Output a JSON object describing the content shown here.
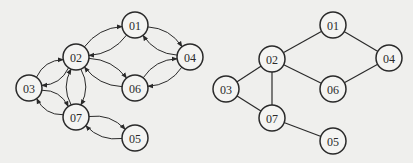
{
  "directed_graph": {
    "title": "",
    "nodes": [
      {
        "id": "01",
        "label": "01",
        "x": 135,
        "y": 25
      },
      {
        "id": "02",
        "label": "02",
        "x": 76,
        "y": 57
      },
      {
        "id": "03",
        "label": "03",
        "x": 29,
        "y": 88
      },
      {
        "id": "04",
        "label": "04",
        "x": 190,
        "y": 57
      },
      {
        "id": "06",
        "label": "06",
        "x": 135,
        "y": 88
      },
      {
        "id": "07",
        "label": "07",
        "x": 76,
        "y": 117
      },
      {
        "id": "05",
        "label": "05",
        "x": 135,
        "y": 138
      }
    ],
    "edges": [
      {
        "from": "01",
        "to": "02"
      },
      {
        "from": "02",
        "to": "01"
      },
      {
        "from": "01",
        "to": "04"
      },
      {
        "from": "04",
        "to": "01"
      },
      {
        "from": "02",
        "to": "03"
      },
      {
        "from": "03",
        "to": "02"
      },
      {
        "from": "02",
        "to": "06"
      },
      {
        "from": "06",
        "to": "02"
      },
      {
        "from": "02",
        "to": "07"
      },
      {
        "from": "07",
        "to": "02"
      },
      {
        "from": "04",
        "to": "06"
      },
      {
        "from": "06",
        "to": "04"
      },
      {
        "from": "03",
        "to": "07"
      },
      {
        "from": "07",
        "to": "03"
      },
      {
        "from": "07",
        "to": "05"
      },
      {
        "from": "05",
        "to": "07"
      }
    ]
  },
  "undirected_graph": {
    "title": "",
    "nodes": [
      {
        "id": "01",
        "label": "01",
        "x": 333,
        "y": 25
      },
      {
        "id": "02",
        "label": "02",
        "x": 272,
        "y": 59
      },
      {
        "id": "03",
        "label": "03",
        "x": 226,
        "y": 89
      },
      {
        "id": "04",
        "label": "04",
        "x": 389,
        "y": 58
      },
      {
        "id": "06",
        "label": "06",
        "x": 333,
        "y": 89
      },
      {
        "id": "07",
        "label": "07",
        "x": 272,
        "y": 118
      },
      {
        "id": "05",
        "label": "05",
        "x": 333,
        "y": 141
      }
    ],
    "edges": [
      {
        "from": "01",
        "to": "02"
      },
      {
        "from": "01",
        "to": "04"
      },
      {
        "from": "02",
        "to": "03"
      },
      {
        "from": "02",
        "to": "06"
      },
      {
        "from": "02",
        "to": "07"
      },
      {
        "from": "04",
        "to": "06"
      },
      {
        "from": "03",
        "to": "07"
      },
      {
        "from": "07",
        "to": "05"
      }
    ]
  },
  "style": {
    "node_radius": 13,
    "stroke_color": "#2a2a2a",
    "node_fill": "#f4f4f2",
    "background": "#efefed"
  }
}
